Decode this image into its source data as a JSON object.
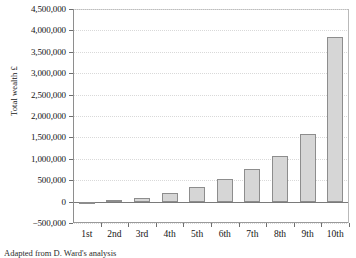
{
  "chart_data": {
    "type": "bar",
    "title": "",
    "xlabel": "",
    "ylabel": "Total wealth £",
    "categories": [
      "1st",
      "2nd",
      "3rd",
      "4th",
      "5th",
      "6th",
      "7th",
      "8th",
      "9th",
      "10th"
    ],
    "values": [
      -10000,
      30000,
      90000,
      200000,
      340000,
      530000,
      760000,
      1060000,
      1580000,
      3850000
    ],
    "ylim": [
      -500000,
      4500000
    ],
    "yticks": [
      -500000,
      0,
      500000,
      1000000,
      1500000,
      2000000,
      2500000,
      3000000,
      3500000,
      4000000,
      4500000
    ],
    "ytick_labels": [
      "−500,000",
      "0",
      "500,000",
      "1,000,000",
      "1,500,000",
      "2,000,000",
      "2,500,000",
      "3,000,000",
      "3,500,000",
      "4,000,000",
      "4,500,000"
    ],
    "grid": true,
    "legend": false,
    "legend_position": "none",
    "bar_fill_color": "#d6d6d6",
    "bar_border_color": "#8d8d8d",
    "gridline_color": "#d9d9d9",
    "axis_color": "#8e8e8e"
  },
  "caption": "Adapted from D. Ward's analysis"
}
